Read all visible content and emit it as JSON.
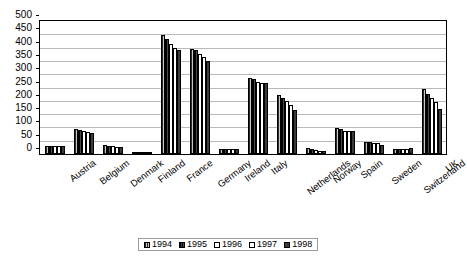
{
  "chart_data": {
    "type": "bar",
    "title": "",
    "xlabel": "",
    "ylabel": "",
    "ylim": [
      0,
      500
    ],
    "ytick_step": 50,
    "yticks": [
      "500",
      "450",
      "400",
      "350",
      "300",
      "250",
      "200",
      "150",
      "100",
      "50",
      "0"
    ],
    "grid": true,
    "legend_position": "bottom",
    "categories": [
      "Austria",
      "Belgium",
      "Denmark",
      "Finland",
      "France",
      "Germany",
      "Ireland",
      "Italy",
      "Netherlands",
      "Norway",
      "Spain",
      "Sweden",
      "Switzerland",
      "UK"
    ],
    "series": [
      {
        "name": "1994",
        "values": [
          32,
          94,
          34,
          3,
          446,
          395,
          19,
          285,
          220,
          21,
          96,
          47,
          20,
          243
        ]
      },
      {
        "name": "1995",
        "values": [
          31,
          90,
          31,
          3,
          432,
          390,
          19,
          281,
          211,
          20,
          94,
          44,
          20,
          224
        ]
      },
      {
        "name": "1996",
        "values": [
          31,
          86,
          29,
          4,
          415,
          375,
          18,
          270,
          200,
          15,
          85,
          42,
          20,
          210
        ]
      },
      {
        "name": "1997",
        "values": [
          30,
          84,
          28,
          5,
          399,
          366,
          18,
          268,
          185,
          13,
          85,
          40,
          20,
          197
        ]
      },
      {
        "name": "1998",
        "values": [
          29,
          80,
          28,
          6,
          390,
          351,
          17,
          268,
          166,
          11,
          88,
          35,
          21,
          170
        ]
      }
    ]
  },
  "legend": {
    "items": [
      {
        "label": "1994",
        "swatch": "hatched-grey"
      },
      {
        "label": "1995",
        "swatch": "hatched-dark"
      },
      {
        "label": "1996",
        "swatch": "white"
      },
      {
        "label": "1997",
        "swatch": "white"
      },
      {
        "label": "1998",
        "swatch": "solid-dark"
      }
    ]
  },
  "colors": {
    "series_1994": "#8f8f8f",
    "series_1995": "#2c2c2c",
    "series_1996": "#ffffff",
    "series_1997": "#ffffff",
    "series_1998": "#3a3a3a",
    "gridline": "#b9b9b9",
    "axis": "#000000",
    "background": "#ffffff"
  }
}
